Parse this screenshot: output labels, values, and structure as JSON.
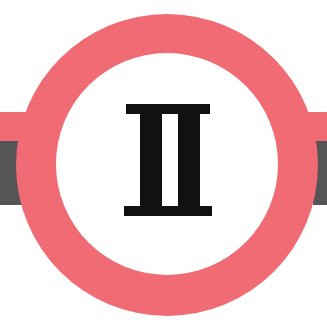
{
  "symbol": {
    "numeral": "II",
    "shape": "ring-with-horizontal-band",
    "colors": {
      "ring": "#f06b74",
      "band_top": "#f06b74",
      "band_bottom": "#555555",
      "inner": "#ffffff",
      "numeral": "#111111",
      "background": "#ffffff"
    }
  }
}
